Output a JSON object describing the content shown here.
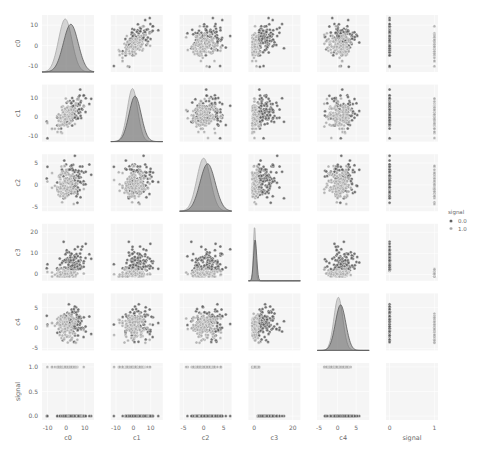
{
  "chart_data": {
    "type": "pairplot",
    "title": "",
    "variables": [
      "c0",
      "c1",
      "c2",
      "c3",
      "c4",
      "signal"
    ],
    "hue": "signal",
    "legend": {
      "title": "signal",
      "position": "right",
      "entries": [
        {
          "label": "0.0",
          "color": "#5a5a5a"
        },
        {
          "label": "1.0",
          "color": "#a8a8a8"
        }
      ]
    },
    "grid": true,
    "cell_background": "#f5f5f5",
    "grid_color": "#ffffff",
    "axes": {
      "c0": {
        "range": [
          -13,
          15
        ],
        "ticks": [
          -10,
          0,
          10
        ],
        "tick_labels": [
          "-10",
          "0",
          "10"
        ]
      },
      "c1": {
        "range": [
          -13,
          17
        ],
        "ticks": [
          -10,
          0,
          10
        ],
        "tick_labels": [
          "-10",
          "0",
          "10"
        ]
      },
      "c2": {
        "range": [
          -6,
          7
        ],
        "ticks": [
          -5,
          0,
          5
        ],
        "tick_labels": [
          "-5",
          "0",
          "5"
        ]
      },
      "c3": {
        "range": [
          -3,
          24
        ],
        "ticks": [
          0,
          10,
          20
        ],
        "tick_labels": [
          "0",
          "10",
          "20"
        ],
        "x_ticks": [
          0,
          20
        ],
        "x_tick_labels": [
          "0",
          "20"
        ]
      },
      "c4": {
        "range": [
          -5.5,
          8.5
        ],
        "ticks": [
          -5,
          0,
          5
        ],
        "tick_labels": [
          "-5",
          "0",
          "5"
        ]
      },
      "signal": {
        "range": [
          -0.08,
          1.08
        ],
        "ticks": [
          0,
          0.5,
          1
        ],
        "tick_labels": [
          "0.0",
          "0.5",
          "1.0"
        ],
        "x_ticks": [
          0,
          1
        ],
        "x_tick_labels": [
          "0",
          "1"
        ]
      }
    },
    "diagonal": {
      "type": "kde",
      "c0": [
        {
          "hue": "0.0",
          "mean": 2.5,
          "sd": 4.0
        },
        {
          "hue": "1.0",
          "mean": -0.5,
          "sd": 3.6
        }
      ],
      "c1": [
        {
          "hue": "0.0",
          "mean": 1.0,
          "sd": 3.5
        },
        {
          "hue": "1.0",
          "mean": -0.5,
          "sd": 3.0
        }
      ],
      "c2": [
        {
          "hue": "0.0",
          "mean": 1.0,
          "sd": 1.9
        },
        {
          "hue": "1.0",
          "mean": 0.0,
          "sd": 1.7
        }
      ],
      "c3": [
        {
          "hue": "0.0",
          "mean": 0.5,
          "sd": 0.8
        },
        {
          "hue": "1.0",
          "mean": 0.2,
          "sd": 0.6
        }
      ],
      "c4": [
        {
          "hue": "0.0",
          "mean": 0.8,
          "sd": 1.4
        },
        {
          "hue": "1.0",
          "mean": 0.2,
          "sd": 1.2
        }
      ]
    },
    "scatter_summary": {
      "n_points_per_group": 110,
      "groups": [
        {
          "hue": "0.0",
          "means": {
            "c0": 3.5,
            "c1": 2.5,
            "c2": 1.2,
            "c3": 3.5,
            "c4": 1.2,
            "signal": 0
          },
          "sds": {
            "c0": 4.0,
            "c1": 4.2,
            "c2": 2.0,
            "c3": 3.5,
            "c4": 2.0
          }
        },
        {
          "hue": "1.0",
          "means": {
            "c0": -1.0,
            "c1": 0.0,
            "c2": 0.0,
            "c3": 1.0,
            "c4": 0.5,
            "signal": 1
          },
          "sds": {
            "c0": 3.2,
            "c1": 3.6,
            "c2": 1.8,
            "c3": 1.5,
            "c4": 1.6
          }
        }
      ],
      "correlation_c0_c1": 0.6
    },
    "xlabel_row": [
      "c0",
      "c1",
      "c2",
      "c3",
      "c4",
      "signal"
    ],
    "ylabel_col": [
      "c0",
      "c1",
      "c2",
      "c3",
      "c4",
      "signal"
    ]
  }
}
